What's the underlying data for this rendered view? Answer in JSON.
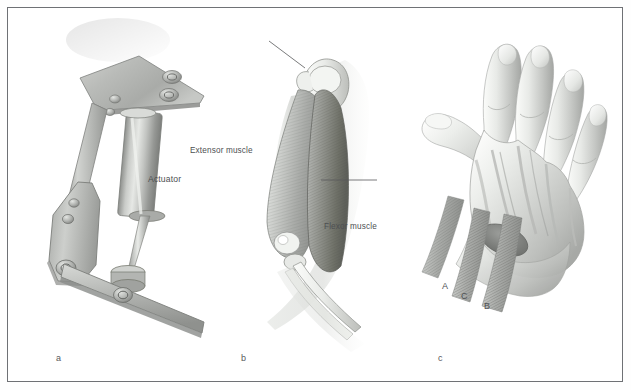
{
  "figure": {
    "caption_letters": [
      "a",
      "b",
      "c"
    ],
    "frame_color": "#6f7175",
    "background_color": "#ffffff",
    "ink_color": "#4d4f52"
  },
  "panel_a": {
    "letter": "a",
    "title": "Mechanical actuator linkage",
    "labels": [
      {
        "text": "Actuator",
        "x": 148,
        "y": 174
      }
    ]
  },
  "panel_b": {
    "letter": "b",
    "title": "Human arm musculature",
    "labels": [
      {
        "text": "Extensor muscle",
        "x": 190,
        "y": 146
      },
      {
        "text": "Flexor muscle",
        "x": 324,
        "y": 222
      }
    ]
  },
  "panel_c": {
    "letter": "c",
    "title": "Human hand with tendon bundles",
    "tendon_labels": [
      {
        "text": "A",
        "x": 442,
        "y": 284
      },
      {
        "text": "C",
        "x": 461,
        "y": 294
      },
      {
        "text": "B",
        "x": 484,
        "y": 303
      }
    ]
  }
}
